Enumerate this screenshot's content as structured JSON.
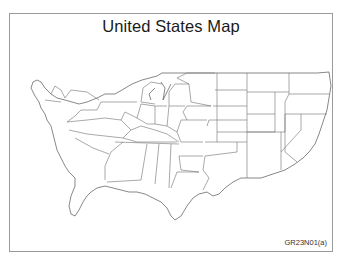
{
  "figure": {
    "title": "United States Map",
    "figure_code": "GR23N01(a)",
    "orientation": "horizontally mirrored",
    "colors": {
      "frame": "#9a9a9a",
      "state_border": "#6e6e6e",
      "background": "#ffffff"
    }
  },
  "map": {
    "region": "Contiguous United States",
    "style": "state outline map, no fill"
  }
}
